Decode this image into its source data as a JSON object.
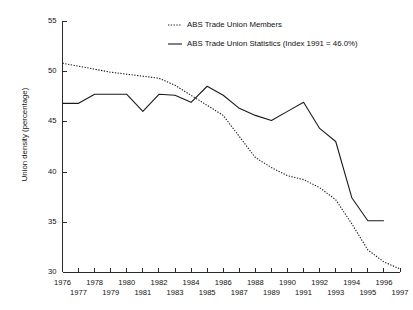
{
  "chart_data": {
    "type": "line",
    "title": "",
    "xlabel": "",
    "ylabel": "Union density (percentage)",
    "ylim": [
      30,
      55
    ],
    "xlim": [
      1976,
      1997
    ],
    "grid": false,
    "legend_position": "top-center",
    "y_ticks": [
      "55",
      "50",
      "45",
      "40",
      "35",
      "30"
    ],
    "x_ticks_top": [
      "1976",
      "1978",
      "1980",
      "1982",
      "1984",
      "1986",
      "1988",
      "1990",
      "1992",
      "1994",
      "1996"
    ],
    "x_ticks_bottom": [
      "1977",
      "1979",
      "1981",
      "1983",
      "1985",
      "1987",
      "1989",
      "1991",
      "1993",
      "1995",
      "1997"
    ],
    "x": [
      1976,
      1977,
      1978,
      1979,
      1980,
      1981,
      1982,
      1983,
      1984,
      1985,
      1986,
      1987,
      1988,
      1989,
      1990,
      1991,
      1992,
      1993,
      1994,
      1995,
      1996,
      1997
    ],
    "series": [
      {
        "name": "ABS Trade Union Members",
        "style": "dotted",
        "x": [
          1976,
          1977,
          1978,
          1979,
          1980,
          1981,
          1982,
          1983,
          1984,
          1985,
          1986,
          1987,
          1988,
          1989,
          1990,
          1991,
          1992,
          1993,
          1994,
          1995,
          1996,
          1997
        ],
        "values": [
          50.8,
          50.5,
          50.2,
          49.9,
          49.7,
          49.5,
          49.3,
          48.6,
          47.6,
          46.6,
          45.6,
          43.5,
          41.4,
          40.4,
          39.6,
          39.2,
          38.4,
          37.2,
          34.8,
          32.2,
          31.0,
          30.3
        ]
      },
      {
        "name": "ABS Trade Union Statistics (Index 1991 = 46.0%)",
        "style": "solid",
        "x": [
          1976,
          1977,
          1978,
          1979,
          1980,
          1981,
          1982,
          1983,
          1984,
          1985,
          1986,
          1987,
          1988,
          1989,
          1990,
          1991,
          1992,
          1993,
          1994,
          1995,
          1996
        ],
        "values": [
          46.8,
          46.8,
          47.7,
          47.7,
          47.7,
          46.0,
          47.7,
          47.6,
          46.9,
          48.5,
          47.6,
          46.3,
          45.6,
          45.1,
          46.0,
          46.9,
          44.3,
          43.0,
          37.4,
          35.1,
          35.1
        ]
      }
    ],
    "legend": [
      {
        "label": "ABS Trade Union Members",
        "style": "dotted"
      },
      {
        "label": "ABS Trade Union Statistics (Index 1991 = 46.0%)",
        "style": "solid"
      }
    ],
    "colors": {
      "line": "#1a1a1a",
      "axis": "#2b2b2b",
      "background": "#ffffff"
    }
  }
}
